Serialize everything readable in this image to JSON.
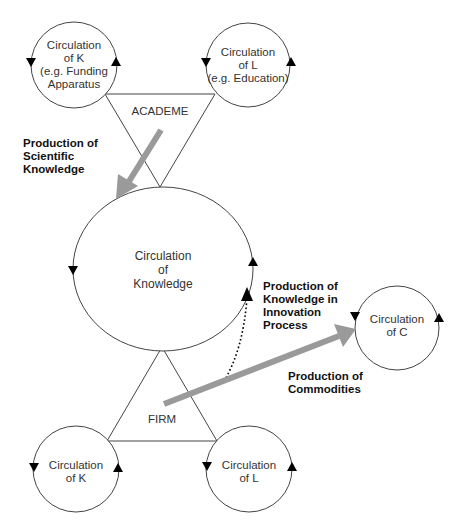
{
  "diagram": {
    "type": "circulation-flow-diagram",
    "colors": {
      "line": "#444444",
      "arrow_fill": "#000000",
      "thick_arrow": "#9a9a9a",
      "text": "#333333"
    },
    "nodes": {
      "academe": {
        "label": "ACADEME",
        "shape": "inverted-triangle"
      },
      "firm": {
        "label": "FIRM",
        "shape": "triangle"
      },
      "knowledge": {
        "line1": "Circulation",
        "line2": "of",
        "line3": "Knowledge"
      },
      "academe_k": {
        "line1": "Circulation",
        "line2": "of K",
        "line3": "(e.g. Funding",
        "line4": "Apparatus"
      },
      "academe_l": {
        "line1": "Circulation",
        "line2": "of L",
        "line3": "(e.g. Education)"
      },
      "commodities_c": {
        "line1": "Circulation",
        "line2": "of C"
      },
      "firm_k": {
        "line1": "Circulation",
        "line2": "of K"
      },
      "firm_l": {
        "line1": "Circulation",
        "line2": "of L"
      }
    },
    "flows": {
      "scientific": {
        "line1": "Production of",
        "line2": "Scientific",
        "line3": "Knowledge"
      },
      "innovation": {
        "line1": "Production of",
        "line2": "Knowledge in",
        "line3": "Innovation",
        "line4": "Process"
      },
      "commodities": {
        "line1": "Production of",
        "line2": "Commodities"
      }
    }
  }
}
